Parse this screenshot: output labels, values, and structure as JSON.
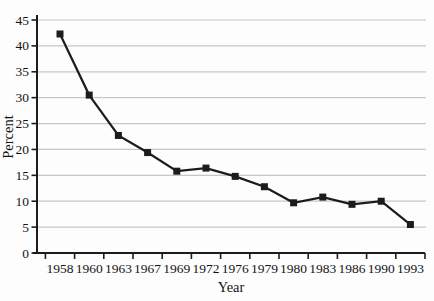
{
  "figure": {
    "background": "#fdfdfd",
    "line_color": "#1c1c1c",
    "marker_color": "#1c1c1c",
    "grid_color": "#c6c6c6",
    "axis_color": "#1c1c1c",
    "text_color": "#141414"
  },
  "chart_data": {
    "type": "line",
    "title": "",
    "xlabel": "Year",
    "ylabel": "Percent",
    "categories": [
      "1958",
      "1960",
      "1963",
      "1967",
      "1969",
      "1972",
      "1976",
      "1979",
      "1980",
      "1983",
      "1986",
      "1990",
      "1993"
    ],
    "values": [
      42.3,
      30.5,
      22.7,
      19.4,
      15.8,
      16.4,
      14.8,
      12.8,
      9.7,
      10.8,
      9.4,
      10.0,
      5.5
    ],
    "series_name": "Percent",
    "ylim": [
      0,
      45
    ],
    "yticks": [
      0,
      5,
      10,
      15,
      20,
      25,
      30,
      35,
      40,
      45
    ],
    "grid": "horizontal",
    "legend": "none",
    "marker": "square",
    "line_style": "solid"
  }
}
